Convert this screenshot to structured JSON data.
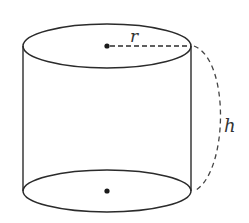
{
  "diagram": {
    "type": "cylinder",
    "labels": {
      "radius": "r",
      "height": "h"
    },
    "colors": {
      "stroke": "#2b2b2b",
      "background": "#ffffff"
    },
    "elements": [
      {
        "id": "top-face",
        "shape": "ellipse",
        "style": "solid"
      },
      {
        "id": "bottom-face",
        "shape": "ellipse",
        "style": "solid"
      },
      {
        "id": "left-side",
        "shape": "line",
        "style": "solid"
      },
      {
        "id": "right-side",
        "shape": "line",
        "style": "solid"
      },
      {
        "id": "top-center",
        "shape": "point"
      },
      {
        "id": "bottom-center",
        "shape": "point"
      },
      {
        "id": "radius-line",
        "shape": "line",
        "style": "dashed",
        "label": "r"
      },
      {
        "id": "height-arc",
        "shape": "arc",
        "style": "dashed",
        "label": "h"
      }
    ]
  }
}
